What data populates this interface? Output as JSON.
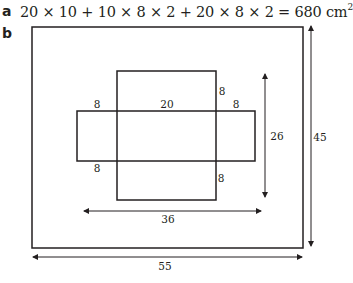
{
  "part_a": {
    "label": "a",
    "equation": "20 × 10 + 10 × 8 × 2 + 20 × 8 × 2 = 680 cm",
    "exponent": "2"
  },
  "part_b": {
    "label": "b",
    "diagram": {
      "outer_width_label": "55",
      "outer_height_label": "45",
      "net_width_label": "36",
      "net_height_label": "26",
      "labels": {
        "top_left_flap": "8",
        "center_width": "20",
        "top_right_flap": "8",
        "top_flap_height": "8",
        "bottom_left_flap": "8",
        "bottom_flap_height": "8"
      }
    }
  }
}
